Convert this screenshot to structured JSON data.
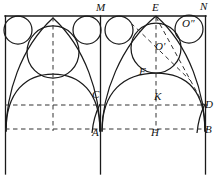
{
  "figure": {
    "width": 214,
    "height": 176,
    "stroke_color": "#1a1a1a",
    "dash_color": "#333333",
    "background": "#ffffff"
  },
  "labels": [
    {
      "id": "M",
      "text": "M",
      "x": 96,
      "y": 2,
      "role": "top-point-left-bay"
    },
    {
      "id": "E",
      "text": "E",
      "x": 152,
      "y": 2,
      "role": "apex-right-bay"
    },
    {
      "id": "N",
      "text": "N",
      "x": 200,
      "y": 1,
      "role": "top-right-corner"
    },
    {
      "id": "Opr",
      "text": "O'",
      "x": 155,
      "y": 41,
      "role": "center-large-circle"
    },
    {
      "id": "Odp",
      "text": "O″",
      "x": 182,
      "y": 18,
      "role": "center-corner-circle"
    },
    {
      "id": "F",
      "text": "F",
      "x": 139,
      "y": 66,
      "role": "tangency-point"
    },
    {
      "id": "C",
      "text": "C",
      "x": 92,
      "y": 89,
      "role": "spring-point-left"
    },
    {
      "id": "K",
      "text": "K",
      "x": 154,
      "y": 91,
      "role": "spring-point-right"
    },
    {
      "id": "D",
      "text": "D",
      "x": 205,
      "y": 99,
      "role": "right-spring-line-end"
    },
    {
      "id": "A",
      "text": "A",
      "x": 92,
      "y": 127,
      "role": "base-point-center"
    },
    {
      "id": "H",
      "text": "H",
      "x": 151,
      "y": 127,
      "role": "base-point-right-bay"
    },
    {
      "id": "B",
      "text": "B",
      "x": 205,
      "y": 124,
      "role": "base-right-corner"
    }
  ],
  "geometry": {
    "frame": {
      "left": 5,
      "right": 205,
      "top": 16,
      "bottom": 172
    },
    "vertical_piers": [
      {
        "name": "left-pier",
        "x": 5
      },
      {
        "name": "middle-pier",
        "x": 100
      },
      {
        "name": "right-pier",
        "x": 205
      }
    ],
    "dashed_horizontals": [
      {
        "name": "spring-line",
        "y": 105,
        "x1": 5,
        "x2": 207
      },
      {
        "name": "impost-line",
        "y": 129,
        "x1": 5,
        "x2": 207
      }
    ],
    "dashed_verticals": [
      {
        "name": "axis-left-bay",
        "x": 53,
        "y1": 16,
        "y2": 131
      },
      {
        "name": "axis-right-bay",
        "x": 156,
        "y1": 16,
        "y2": 131
      }
    ],
    "circles": [
      {
        "name": "small-circle-1",
        "cx": 18,
        "cy": 30,
        "r": 14
      },
      {
        "name": "small-circle-2",
        "cx": 87,
        "cy": 30,
        "r": 14
      },
      {
        "name": "small-circle-3",
        "cx": 119,
        "cy": 30,
        "r": 14
      },
      {
        "name": "corner-circle-O-double-prime",
        "cx": 189,
        "cy": 29,
        "r": 14
      },
      {
        "name": "large-circle-left",
        "cx": 53,
        "cy": 52,
        "r": 26
      },
      {
        "name": "large-circle-O-prime",
        "cx": 156,
        "cy": 48,
        "r": 25
      }
    ],
    "arcs": [
      {
        "name": "left-bay-ogee-left",
        "from": "left pier",
        "to": "apex"
      },
      {
        "name": "left-bay-ogee-right",
        "from": "apex",
        "to": "middle pier"
      },
      {
        "name": "right-bay-ogee-left",
        "from": "middle pier",
        "to": "E"
      },
      {
        "name": "right-bay-ogee-right",
        "from": "E",
        "to": "right pier"
      },
      {
        "name": "low-arc-left",
        "from": "left pier",
        "to": "A"
      },
      {
        "name": "low-arc-right",
        "from": "A",
        "to": "B"
      }
    ],
    "dashed_diagonals": [
      {
        "name": "diagonal-E-to-D",
        "x1": 156,
        "y1": 16,
        "x2": 206,
        "y2": 108
      },
      {
        "name": "diagonal-O-prime-upper-left",
        "x1": 132,
        "y1": 24,
        "x2": 190,
        "y2": 80
      }
    ]
  }
}
